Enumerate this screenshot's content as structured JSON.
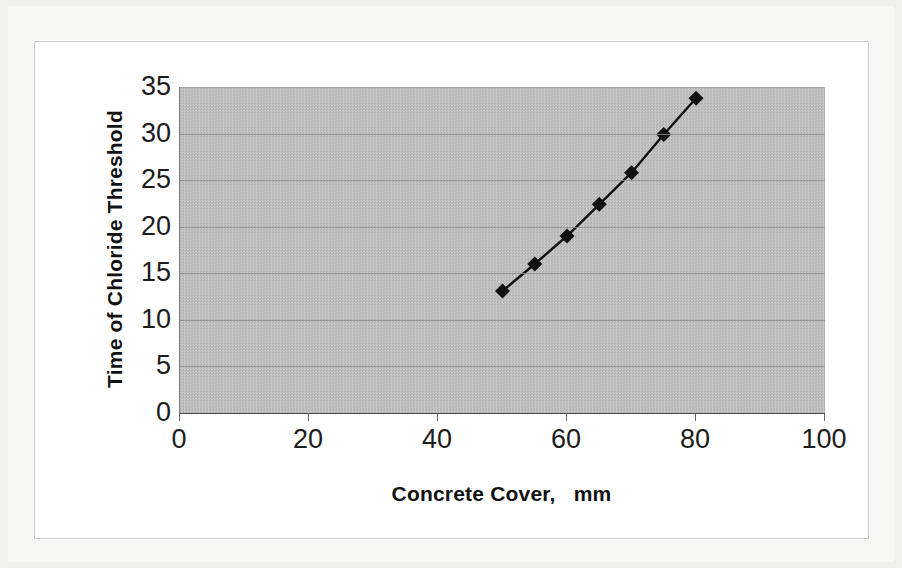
{
  "chart_data": {
    "type": "line",
    "title": "",
    "xlabel": "Concrete Cover,   mm",
    "ylabel": "Time of Chloride Threshold",
    "xlim": [
      0,
      100
    ],
    "ylim": [
      0,
      35
    ],
    "xticks": [
      "0",
      "20",
      "40",
      "60",
      "80",
      "100"
    ],
    "xtick_values": [
      0,
      20,
      40,
      60,
      80,
      100
    ],
    "yticks": [
      "0",
      "5",
      "10",
      "15",
      "20",
      "25",
      "30",
      "35"
    ],
    "ytick_values": [
      0,
      5,
      10,
      15,
      20,
      25,
      30,
      35
    ],
    "grid": "horizontal",
    "legend": "none",
    "marker": "diamond",
    "series": [
      {
        "name": "Time of Chloride Threshold",
        "x": [
          50,
          55,
          60,
          65,
          70,
          75,
          80
        ],
        "values": [
          13.1,
          16.0,
          19.0,
          22.4,
          25.8,
          29.9,
          33.8
        ]
      }
    ],
    "colors": {
      "plot_background": "#bdbdbd",
      "gridline": "#8d8d8d",
      "series_line": "#111111",
      "marker_fill": "#111111",
      "axis_text": "#1c1c1c",
      "title_text": "#111111",
      "chart_background": "#ffffff",
      "page_background": "#f2f2f2"
    }
  }
}
